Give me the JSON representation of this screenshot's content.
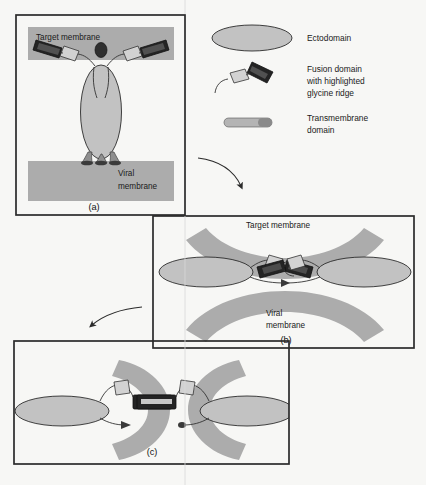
{
  "figure": {
    "background_color": "#f7f7f5",
    "membrane_color": "#acacac",
    "ectodomain_color": "#c2c2c2",
    "fusion_domain_dark_color": "#242424",
    "fusion_domain_light_color": "#d2d2d2",
    "frame_color": "#2b2b2b"
  },
  "legend": {
    "items": [
      {
        "icon": "ellipse-icon",
        "label": "Ectodomain"
      },
      {
        "icon": "fusion-domain-icon",
        "label": "Fusion domain\nwith highlighted\nglycine ridge",
        "line1": "Fusion domain",
        "line2": "with highlighted",
        "line3": "glycine ridge"
      },
      {
        "icon": "capsule-icon",
        "label": "Transmembrane\ndomain",
        "line1": "Transmembrane",
        "line2": "domain"
      }
    ]
  },
  "panels": [
    {
      "id": "a",
      "caption": "(a)",
      "labels": {
        "target_membrane": "Target membrane",
        "viral_membrane_line1": "Viral",
        "viral_membrane_line2": "membrane"
      }
    },
    {
      "id": "b",
      "caption": "(b)",
      "labels": {
        "target_membrane": "Target membrane",
        "viral_membrane_line1": "Viral",
        "viral_membrane_line2": "membrane"
      }
    },
    {
      "id": "c",
      "caption": "(c)",
      "labels": {}
    }
  ],
  "arrows": [
    {
      "name": "arrow-a-to-b",
      "direction": "down-right"
    },
    {
      "name": "arrow-b-to-c",
      "direction": "down-left"
    }
  ]
}
